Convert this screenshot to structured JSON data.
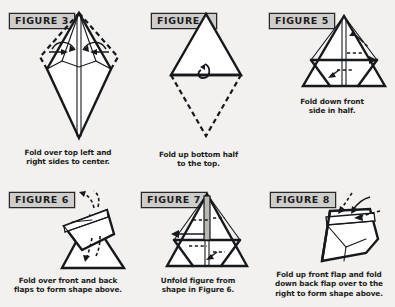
{
  "page": {
    "background_color": "#f2f1ef",
    "ink_color": "#17181c",
    "badge_fill": "#cfcdc9"
  },
  "figures": [
    {
      "label": "FIGURE 3",
      "caption": "Fold over top left and\nright sides to center.",
      "diagram": "kite-with-side-flaps-dashed"
    },
    {
      "label": "FIGURE 4",
      "caption": "Fold up bottom half\nto the top.",
      "diagram": "diamond-upper-solid-lower-dashed"
    },
    {
      "label": "FIGURE 5",
      "caption": "Fold down front\nside in half.",
      "diagram": "triangle-with-inner-creases"
    },
    {
      "label": "FIGURE 6",
      "caption": "Fold over front and back\nflaps to form shape above.",
      "diagram": "triangle-with-folded-top-flaps"
    },
    {
      "label": "FIGURE 7",
      "caption": "Unfold figure from\nshape in Figure 6.",
      "diagram": "triangle-unfolded-creases"
    },
    {
      "label": "FIGURE 8",
      "caption": "Fold up front flap and fold\ndown back flap over to the\nright to form shape above.",
      "diagram": "angled-shape-with-flaps"
    }
  ]
}
